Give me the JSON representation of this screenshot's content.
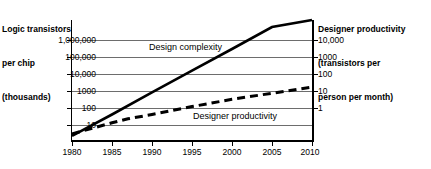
{
  "chart_data": {
    "type": "line",
    "title": "",
    "subtitle": "",
    "xlabel": "",
    "ylabel": "Logic transistors per chip (thousands)",
    "y2label": "Designer productivity (transistors per person per month)",
    "grid": true,
    "legend_position": "inline-annotations",
    "x_scale": "linear",
    "y_scale": "log",
    "xlim": [
      1980,
      2010
    ],
    "ylim": [
      5,
      4000000
    ],
    "y2lim": [
      0.05,
      40000
    ],
    "x_ticks": [
      1980,
      1985,
      1990,
      1995,
      2000,
      2005,
      2010
    ],
    "x_tick_labels": [
      "1980",
      "1985",
      "1990",
      "1995",
      "2000",
      "2005",
      "2010"
    ],
    "y_ticks": [
      10,
      100,
      1000,
      10000,
      100000,
      1000000
    ],
    "y_tick_labels": [
      "10",
      "100",
      "1000",
      "10,000",
      "100,000",
      "1,000,000"
    ],
    "y2_ticks": [
      1,
      10,
      100,
      1000,
      10000
    ],
    "y2_tick_labels": [
      "1",
      "10",
      "100",
      "1000",
      "10,000"
    ],
    "series": [
      {
        "name": "Design complexity",
        "axis": "left",
        "style": "solid",
        "x": [
          1980,
          1985,
          1990,
          1995,
          2000,
          2005,
          2010
        ],
        "values": [
          8,
          90,
          1100,
          13000,
          150000,
          1800000,
          4000000
        ]
      },
      {
        "name": "Designer productivity",
        "axis": "right",
        "style": "dashed",
        "x": [
          1980,
          1985,
          1987,
          1990,
          1995,
          2000,
          2005,
          2010
        ],
        "values": [
          0.1,
          0.35,
          0.55,
          0.9,
          2.2,
          5.0,
          10.0,
          20.0
        ]
      }
    ],
    "annotations": [
      {
        "text": "Design complexity",
        "x": 1991,
        "y": 300000
      },
      {
        "text": "Designer productivity",
        "x": 1997,
        "y": 40
      }
    ]
  },
  "left_axis": {
    "title_line1": "Logic transistors",
    "title_line2": "per chip",
    "title_line3": "(thousands)",
    "tick_labels": [
      "1,000,000",
      "100,000",
      "10,000",
      "1000",
      "100",
      "10"
    ]
  },
  "right_axis": {
    "title_line1": "Designer productivity",
    "title_line2": "(transistors per",
    "title_line3": "person per month)",
    "tick_labels": [
      "10,000",
      "1000",
      "100",
      "10",
      "1"
    ]
  },
  "x_axis": {
    "tick_labels": [
      "1980",
      "1985",
      "1990",
      "1995",
      "2000",
      "2005",
      "2010"
    ]
  },
  "series_labels": {
    "design_complexity": "Design complexity",
    "designer_productivity": "Designer productivity"
  },
  "colors": {
    "line": "#000000",
    "grid": "#6d6d6d",
    "axis": "#000000",
    "background": "#ffffff",
    "text": "#000000"
  }
}
